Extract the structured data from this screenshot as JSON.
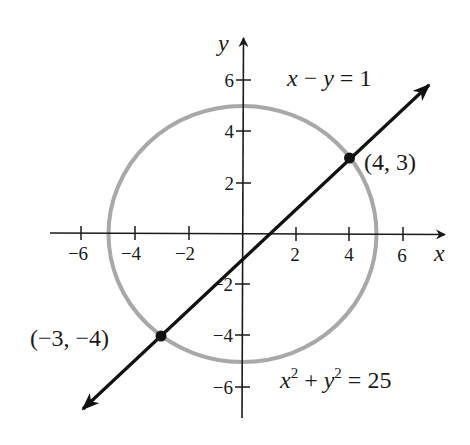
{
  "diagram": {
    "title": "",
    "axes": {
      "x_label": "x",
      "y_label": "y",
      "x_ticks": [
        {
          "value": -6,
          "label": "−6"
        },
        {
          "value": -4,
          "label": "−4"
        },
        {
          "value": -2,
          "label": "−2"
        },
        {
          "value": 2,
          "label": "2"
        },
        {
          "value": 4,
          "label": "4"
        },
        {
          "value": 6,
          "label": "6"
        }
      ],
      "y_ticks": [
        {
          "value": 6,
          "label": "6"
        },
        {
          "value": 4,
          "label": "4"
        },
        {
          "value": 2,
          "label": "2"
        },
        {
          "value": -2,
          "label": "−2"
        },
        {
          "value": -4,
          "label": "−4"
        },
        {
          "value": -6,
          "label": "−6"
        }
      ]
    },
    "line": {
      "equation_parts": {
        "x": "x",
        "minus": " − ",
        "y": "y",
        "eq": " = 1"
      },
      "equation": "x − y = 1",
      "color": "#111111"
    },
    "circle": {
      "equation_parts": {
        "x": "x",
        "xexp": "2",
        "plus": " + ",
        "y": "y",
        "yexp": "2",
        "eq": " = 25"
      },
      "equation": "x² + y² = 25",
      "radius": 5,
      "color": "#a8a8a8"
    },
    "intersections": [
      {
        "x": 4,
        "y": 3,
        "label": "(4, 3)"
      },
      {
        "x": -3,
        "y": -4,
        "label": "(−3, −4)"
      }
    ]
  }
}
